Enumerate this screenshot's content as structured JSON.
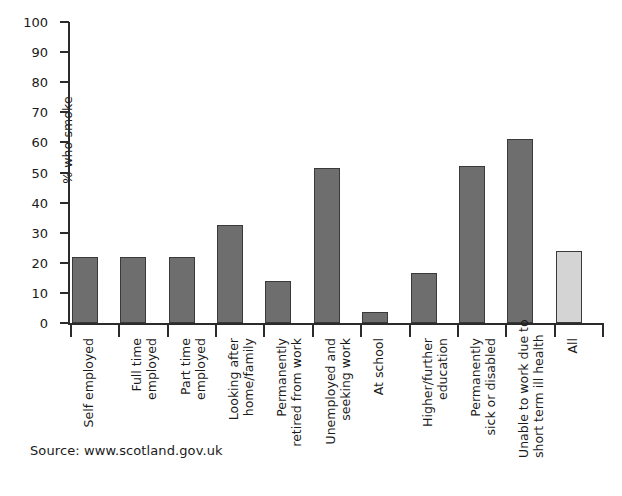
{
  "chart_data": {
    "type": "bar",
    "title": "",
    "xlabel": "",
    "ylabel": "% who smoke",
    "ylim": [
      0,
      100
    ],
    "ytick_step": 10,
    "yticks": [
      0,
      10,
      20,
      30,
      40,
      50,
      60,
      70,
      80,
      90,
      100
    ],
    "grid": false,
    "legend": "none",
    "categories": [
      "Self employed",
      "Full time employed",
      "Part time employed",
      "Looking after home/family",
      "Permanently retired from work",
      "Unemployed and seeking work",
      "At school",
      "Higher/further education",
      "Permanently sick or disabled",
      "Unable to work due to short term ill health",
      "All"
    ],
    "category_label_lines": [
      [
        "Self employed"
      ],
      [
        "Full time",
        "employed"
      ],
      [
        "Part time",
        "employed"
      ],
      [
        "Looking after",
        "home/family"
      ],
      [
        "Permanently",
        "retired from work"
      ],
      [
        "Unemployed and",
        "seeking work"
      ],
      [
        "At school"
      ],
      [
        "Higher/further",
        "education"
      ],
      [
        "Permanently",
        "sick or disabled"
      ],
      [
        "Unable to work due to",
        "short term ill health"
      ],
      [
        "All"
      ]
    ],
    "values": [
      22,
      22,
      22,
      32.5,
      14,
      51.5,
      3.5,
      16.5,
      52,
      61,
      24
    ],
    "bar_colors": [
      "#6e6e6e",
      "#6e6e6e",
      "#6e6e6e",
      "#6e6e6e",
      "#6e6e6e",
      "#6e6e6e",
      "#6e6e6e",
      "#6e6e6e",
      "#6e6e6e",
      "#6e6e6e",
      "#d4d4d4"
    ],
    "bar_edge_color": "#3a3a3a"
  },
  "axes": {
    "y_label": "% who smoke",
    "y_tick_labels": [
      "0",
      "10",
      "20",
      "30",
      "40",
      "50",
      "60",
      "70",
      "80",
      "90",
      "100"
    ]
  },
  "footer": {
    "source": "Source: www.scotland.gov.uk"
  },
  "colors": {
    "axis": "#2b2b2b",
    "bar_dark": "#6e6e6e",
    "bar_light": "#d4d4d4",
    "bar_edge": "#3a3a3a",
    "background": "#ffffff",
    "text": "#1a1a1a"
  }
}
